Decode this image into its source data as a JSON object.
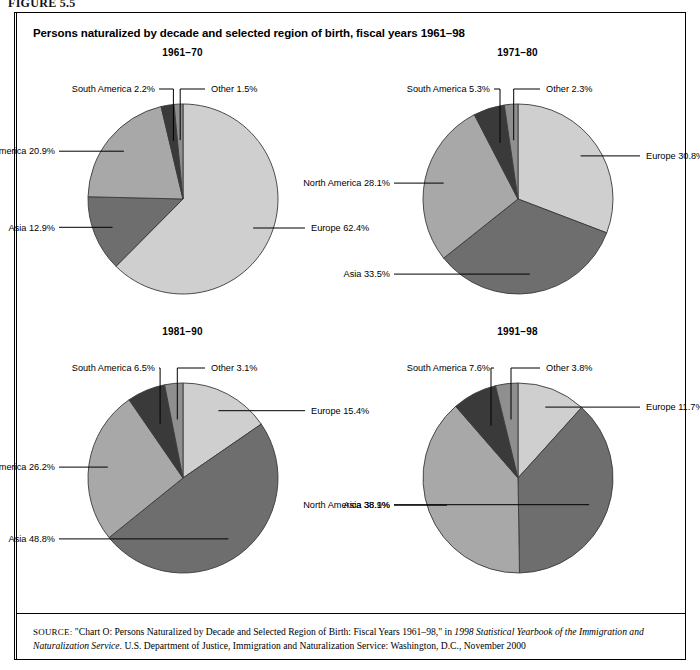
{
  "figure_label": "FIGURE 5.5",
  "title": "Persons naturalized by decade and selected region of birth, fiscal years 1961–98",
  "source": {
    "prefix": "SOURCE:",
    "part1": " \"Chart O: Persons Naturalized by Decade and Selected Region of Birth: Fiscal Years 1961–98,\" in ",
    "italic1": "1998 Statistical Yearbook of the Immigration and Naturalization Service",
    "part2": ". U.S. Department of Justice, Immigration and Naturalization Service: Washington, D.C., November 2000"
  },
  "colors": {
    "europe": "#cfcfcf",
    "asia": "#6e6e6e",
    "north_america": "#a8a8a8",
    "south_america": "#3a3a3a",
    "other": "#8f8f8f",
    "outline": "#3a3a3a"
  },
  "chart_data": [
    {
      "type": "pie",
      "title": "1961–70",
      "labels": [
        "Europe",
        "Asia",
        "North America",
        "South America",
        "Other"
      ],
      "values": [
        62.4,
        12.9,
        20.9,
        2.2,
        1.5
      ],
      "unit": "%",
      "annotations": [
        "Europe 62.4%",
        "Asia 12.9%",
        "North America 20.9%",
        "South America 2.2%",
        "Other 1.5%"
      ]
    },
    {
      "type": "pie",
      "title": "1971–80",
      "labels": [
        "Europe",
        "Asia",
        "North America",
        "South America",
        "Other"
      ],
      "values": [
        30.8,
        33.5,
        28.1,
        5.3,
        2.3
      ],
      "unit": "%",
      "annotations": [
        "Europe 30.8%",
        "Asia 33.5%",
        "North America 28.1%",
        "South America 5.3%",
        "Other 2.3%"
      ]
    },
    {
      "type": "pie",
      "title": "1981–90",
      "labels": [
        "Europe",
        "Asia",
        "North America",
        "South America",
        "Other"
      ],
      "values": [
        15.4,
        48.8,
        26.2,
        6.5,
        3.1
      ],
      "unit": "%",
      "annotations": [
        "Europe 15.4%",
        "Asia 48.8%",
        "North America 26.2%",
        "South America 6.5%",
        "Other 3.1%"
      ]
    },
    {
      "type": "pie",
      "title": "1991–98",
      "labels": [
        "Europe",
        "Asia",
        "North America",
        "South America",
        "Other"
      ],
      "values": [
        11.7,
        38.1,
        38.9,
        7.6,
        3.8
      ],
      "unit": "%",
      "annotations": [
        "Europe 11.7%",
        "Asia 38.1%",
        "North America 38.9%",
        "South America 7.6%",
        "Other 3.8%"
      ]
    }
  ]
}
